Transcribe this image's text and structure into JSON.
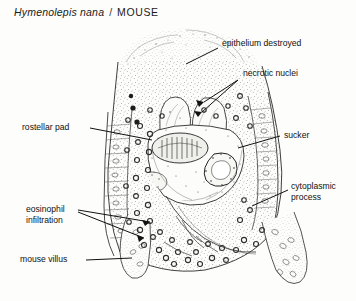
{
  "figure": {
    "title": {
      "species": "Hymenolepis nana",
      "separator": "/",
      "host": "MOUSE"
    },
    "type": "histology-illustration",
    "ink_color": "#1a1a1a",
    "background_color": "#fdfdfb",
    "labels": [
      {
        "id": "epithelium-destroyed",
        "text": "epithelium destroyed",
        "x": 222,
        "y": 44
      },
      {
        "id": "necrotic-nuclei",
        "text": "necrotic nuclei",
        "x": 243,
        "y": 74
      },
      {
        "id": "rostellar-pad",
        "text": "rostellar pad",
        "x": 22,
        "y": 126
      },
      {
        "id": "sucker",
        "text": "sucker",
        "x": 284,
        "y": 133
      },
      {
        "id": "cytoplasmic-process",
        "line1": "cytoplasmic",
        "line2": "process",
        "x": 291,
        "y": 186
      },
      {
        "id": "eosinophil-infiltration",
        "line1": "eosinophil",
        "line2": "infiltration",
        "x": 26,
        "y": 209
      },
      {
        "id": "mouse-villus",
        "text": "mouse villus",
        "x": 20,
        "y": 258
      }
    ]
  }
}
